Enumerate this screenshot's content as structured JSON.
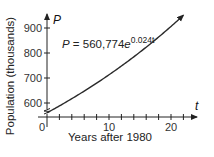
{
  "chart_data": {
    "type": "line",
    "title": "",
    "equation": {
      "lhs": "P = 560,774",
      "base": "e",
      "exponent": "0.024t"
    },
    "model": {
      "a": 560.774,
      "k": 0.024
    },
    "xlabel": "Years after 1980",
    "ylabel": "Population (thousands)",
    "x_var": "t",
    "y_var": "P",
    "xlim": [
      0,
      24
    ],
    "ylim": [
      540,
      940
    ],
    "y_axis_break": true,
    "x_ticks": [
      0,
      2,
      4,
      6,
      8,
      10,
      12,
      14,
      16,
      18,
      20,
      22
    ],
    "x_tick_labels": [
      {
        "value": 0,
        "label": "0"
      },
      {
        "value": 10,
        "label": "10"
      },
      {
        "value": 20,
        "label": "20"
      }
    ],
    "y_ticks": [
      600,
      700,
      800,
      900
    ],
    "y_tick_labels": [
      {
        "value": 600,
        "label": "600"
      },
      {
        "value": 700,
        "label": "700"
      },
      {
        "value": 800,
        "label": "800"
      },
      {
        "value": 900,
        "label": "900"
      }
    ],
    "series": [
      {
        "name": "P = 560,774e^(0.024t)",
        "x": [
          0,
          2,
          4,
          6,
          8,
          10,
          12,
          14,
          16,
          18,
          20,
          22
        ],
        "y": [
          560.8,
          588.3,
          617.2,
          647.6,
          679.4,
          712.8,
          747.8,
          784.6,
          823.1,
          863.6,
          906.0,
          950.5
        ]
      }
    ],
    "grid": false,
    "legend": "none"
  }
}
